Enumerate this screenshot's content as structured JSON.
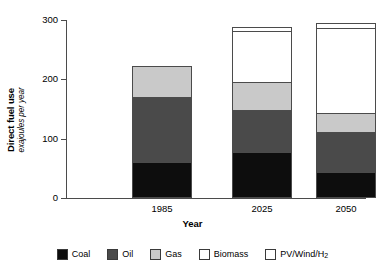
{
  "chart_data": {
    "type": "bar",
    "subtype": "stacked",
    "title": "",
    "xlabel": "Year",
    "ylabel": "Direct fuel use",
    "ylabel_sub": "exajoules per year",
    "ylim": [
      0,
      300
    ],
    "yticks": [
      0,
      100,
      200,
      300
    ],
    "ytick_labels": [
      "0",
      "100",
      "200",
      "300"
    ],
    "grid": false,
    "legend_position": "bottom",
    "categories": [
      "1985",
      "2025",
      "2050"
    ],
    "series": [
      {
        "name": "Coal",
        "color": "#0d0d0d",
        "values": [
          60,
          78,
          44
        ]
      },
      {
        "name": "Oil",
        "color": "#4a4a4a",
        "values": [
          110,
          70,
          68
        ]
      },
      {
        "name": "Gas",
        "color": "#c9c9c9",
        "values": [
          52,
          47,
          31
        ]
      },
      {
        "name": "Biomass",
        "color": "#ffffff",
        "values": [
          0,
          86,
          144
        ]
      },
      {
        "name": "PV/Wind/H2",
        "color": "#ffffff",
        "values": [
          0,
          7,
          8
        ]
      }
    ],
    "totals": [
      222,
      288,
      295
    ]
  },
  "axis": {
    "y_title_main": "Direct fuel use",
    "y_title_sub": "exajoules per year",
    "x_title": "Year",
    "y_ticks": [
      "300",
      "200",
      "100",
      "0"
    ],
    "x_ticks": [
      "1985",
      "2025",
      "2050"
    ]
  },
  "legend": {
    "items": [
      {
        "label": "Coal",
        "sub": "",
        "color": "#0d0d0d"
      },
      {
        "label": "Oil",
        "sub": "",
        "color": "#4a4a4a"
      },
      {
        "label": "Gas",
        "sub": "",
        "color": "#c9c9c9"
      },
      {
        "label": "Biomass",
        "sub": "",
        "color": "#ffffff"
      },
      {
        "label": "PV/Wind/H",
        "sub": "2",
        "color": "#ffffff"
      }
    ]
  }
}
